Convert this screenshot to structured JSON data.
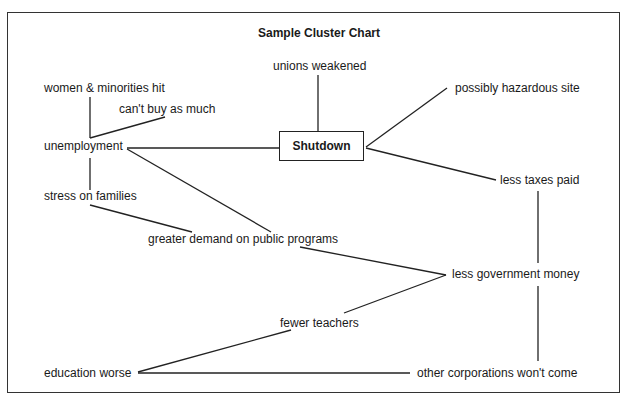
{
  "title": "Sample Cluster Chart",
  "center": "Shutdown",
  "nodes": {
    "unions": "unions weakened",
    "women": "women & minorities hit",
    "cant_buy": "can't buy as much",
    "unemployment": "unemployment",
    "hazard": "possibly hazardous site",
    "taxes": "less taxes paid",
    "stress": "stress on families",
    "demand": "greater demand on public programs",
    "gov_money": "less government money",
    "teachers": "fewer teachers",
    "education": "education worse",
    "corporations": "other corporations won't come"
  },
  "edges": [
    [
      "Shutdown",
      "unions weakened"
    ],
    [
      "Shutdown",
      "unemployment"
    ],
    [
      "Shutdown",
      "possibly hazardous site"
    ],
    [
      "Shutdown",
      "less taxes paid"
    ],
    [
      "unemployment",
      "women & minorities hit"
    ],
    [
      "unemployment",
      "can't buy as much"
    ],
    [
      "unemployment",
      "stress on families"
    ],
    [
      "unemployment",
      "greater demand on public programs"
    ],
    [
      "stress on families",
      "greater demand on public programs"
    ],
    [
      "greater demand on public programs",
      "less government money"
    ],
    [
      "less taxes paid",
      "less government money"
    ],
    [
      "less government money",
      "fewer teachers"
    ],
    [
      "less government money",
      "other corporations won't come"
    ],
    [
      "fewer teachers",
      "education worse"
    ],
    [
      "education worse",
      "other corporations won't come"
    ]
  ]
}
